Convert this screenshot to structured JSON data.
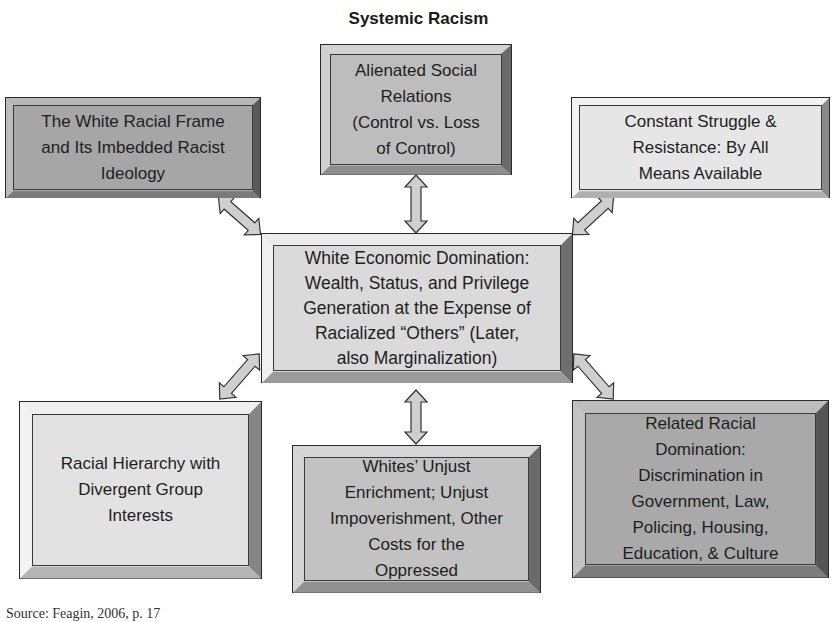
{
  "diagram": {
    "title": "Systemic Racism",
    "center": {
      "label": "White Economic Domination:\nWealth, Status, and Privilege\nGeneration at the Expense of\nRacialized “Others” (Later,\nalso Marginalization)",
      "fill": "#dadada"
    },
    "nodes": [
      {
        "id": "alienated-social-relations",
        "label": "Alienated Social\nRelations\n(Control vs. Loss\nof Control)",
        "fill": "#bdbdbd"
      },
      {
        "id": "white-racial-frame",
        "label": "The White Racial Frame\nand Its Imbedded Racist\nIdeology",
        "fill": "#a6a6a6"
      },
      {
        "id": "constant-struggle",
        "label": "Constant Struggle &\nResistance: By All\nMeans Available",
        "fill": "#e6e6e6"
      },
      {
        "id": "racial-hierarchy",
        "label": "Racial Hierarchy with\nDivergent Group\nInterests",
        "fill": "#e2e2e2"
      },
      {
        "id": "unjust-enrichment",
        "label": "Whites’ Unjust\nEnrichment; Unjust\nImpoverishment, Other\nCosts for the\nOppressed",
        "fill": "#c2c2c2"
      },
      {
        "id": "related-racial-domination",
        "label": "Related Racial\nDomination:\nDiscrimination in\nGovernment, Law,\nPolicing, Housing,\nEducation, & Culture",
        "fill": "#a9a9a9"
      }
    ],
    "edges": [
      {
        "from": "center",
        "to": "alienated-social-relations",
        "type": "bidirectional"
      },
      {
        "from": "center",
        "to": "white-racial-frame",
        "type": "bidirectional"
      },
      {
        "from": "center",
        "to": "constant-struggle",
        "type": "bidirectional"
      },
      {
        "from": "center",
        "to": "racial-hierarchy",
        "type": "bidirectional"
      },
      {
        "from": "center",
        "to": "unjust-enrichment",
        "type": "bidirectional"
      },
      {
        "from": "center",
        "to": "related-racial-domination",
        "type": "bidirectional"
      }
    ],
    "arrow_fill": "#cfcfcf",
    "footer": "Source: Feagin, 2006, p. 17"
  }
}
